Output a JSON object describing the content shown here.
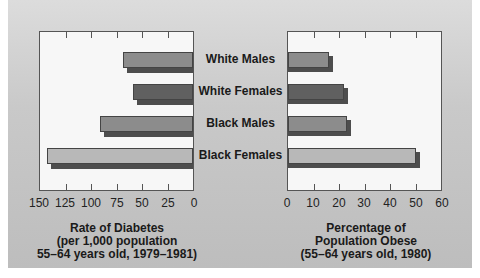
{
  "chart_data": [
    {
      "type": "bar",
      "orientation": "horizontal",
      "direction": "right-to-left",
      "categories": [
        "White Males",
        "White Females",
        "Black Males",
        "Black Females"
      ],
      "values": [
        69,
        59,
        91,
        143
      ],
      "xlabel": "Rate of Diabetes (per 1,000 population 55–64 years old, 1979–1981)",
      "xlim": [
        0,
        150
      ],
      "xticks": [
        150,
        125,
        100,
        75,
        50,
        25,
        0
      ],
      "grid": false,
      "legend": null
    },
    {
      "type": "bar",
      "orientation": "horizontal",
      "direction": "left-to-right",
      "categories": [
        "White Males",
        "White Females",
        "Black Males",
        "Black Females"
      ],
      "values": [
        16,
        22,
        23,
        50
      ],
      "xlabel": "Percentage of Population Obese (55–64 years old, 1980)",
      "xlim": [
        0,
        60
      ],
      "xticks": [
        0,
        10,
        20,
        30,
        40,
        50,
        60
      ],
      "grid": false,
      "legend": null
    }
  ],
  "labels": {
    "categories": [
      "White Males",
      "White Females",
      "Black Males",
      "Black Females"
    ],
    "left_ticks": [
      "150",
      "125",
      "100",
      "75",
      "50",
      "25",
      "0"
    ],
    "right_ticks": [
      "0",
      "10",
      "20",
      "30",
      "40",
      "50",
      "60"
    ],
    "left_title": [
      "Rate of Diabetes",
      "(per 1,000 population",
      "55–64 years old, 1979–1981)"
    ],
    "right_title": [
      "Percentage of",
      "Population Obese",
      "(55–64 years old, 1980)"
    ]
  },
  "colors": {
    "white_males": "#8c8c8c",
    "white_females": "#606060",
    "black_males": "#8c8c8c",
    "black_females": "#b8b8b8",
    "shadow": "#4d4d4d"
  }
}
